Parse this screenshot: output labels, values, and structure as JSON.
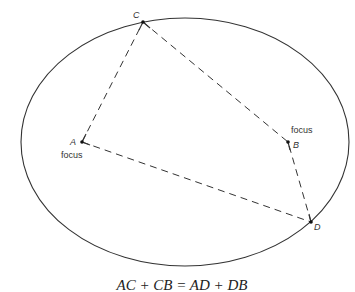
{
  "diagram": {
    "type": "ellipse-foci",
    "ellipse": {
      "cx": 185,
      "cy": 142,
      "rx": 164,
      "ry": 124,
      "stroke": "#333333"
    },
    "points": {
      "A": {
        "label": "A",
        "sublabel": "focus",
        "x": 82,
        "y": 142
      },
      "B": {
        "label": "B",
        "sublabel": "focus",
        "x": 288,
        "y": 142
      },
      "C": {
        "label": "C",
        "x": 143,
        "y": 22
      },
      "D": {
        "label": "D",
        "x": 311,
        "y": 222
      }
    },
    "segments": [
      {
        "from": "A",
        "to": "C",
        "style": "dashed"
      },
      {
        "from": "C",
        "to": "B",
        "style": "dashed"
      },
      {
        "from": "A",
        "to": "D",
        "style": "dashed"
      },
      {
        "from": "D",
        "to": "B",
        "style": "dashed"
      }
    ],
    "caption": "AC + CB = AD + DB"
  }
}
